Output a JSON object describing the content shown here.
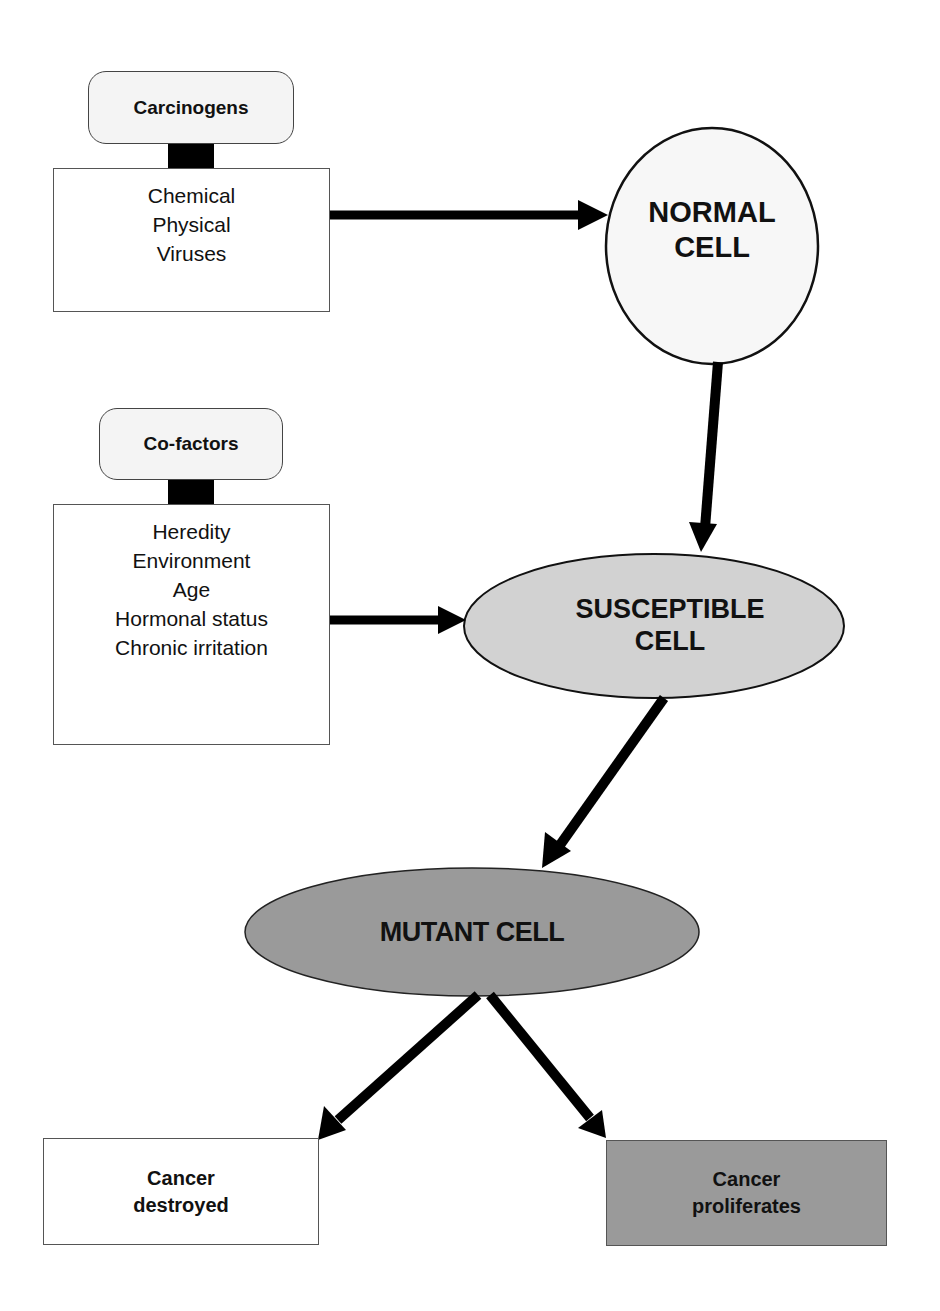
{
  "diagram": {
    "type": "flowchart",
    "colors": {
      "normal_cell_fill": "#f7f7f7",
      "susceptible_cell_fill": "#d2d2d2",
      "mutant_cell_fill": "#9a9a9a",
      "proliferates_fill": "#9a9a9a",
      "destroyed_fill": "#ffffff",
      "arrow": "#000000"
    },
    "carcinogens": {
      "title": "Carcinogens",
      "items": [
        "Chemical",
        "Physical",
        "Viruses"
      ]
    },
    "cofactors": {
      "title": "Co-factors",
      "items": [
        "Heredity",
        "Environment",
        "Age",
        "Hormonal status",
        "Chronic irritation"
      ]
    },
    "nodes": {
      "normal_cell": {
        "line1": "NORMAL",
        "line2": "CELL"
      },
      "susceptible_cell": {
        "line1": "SUSCEPTIBLE",
        "line2": "CELL"
      },
      "mutant_cell": {
        "label": "MUTANT CELL"
      }
    },
    "outcomes": {
      "destroyed": {
        "line1": "Cancer",
        "line2": "destroyed"
      },
      "proliferates": {
        "line1": "Cancer",
        "line2": "proliferates"
      }
    },
    "edges": [
      {
        "from": "Carcinogens",
        "to": "NORMAL CELL"
      },
      {
        "from": "NORMAL CELL",
        "to": "SUSCEPTIBLE CELL"
      },
      {
        "from": "Co-factors",
        "to": "SUSCEPTIBLE CELL"
      },
      {
        "from": "SUSCEPTIBLE CELL",
        "to": "MUTANT CELL"
      },
      {
        "from": "MUTANT CELL",
        "to": "Cancer destroyed"
      },
      {
        "from": "MUTANT CELL",
        "to": "Cancer proliferates"
      }
    ]
  }
}
